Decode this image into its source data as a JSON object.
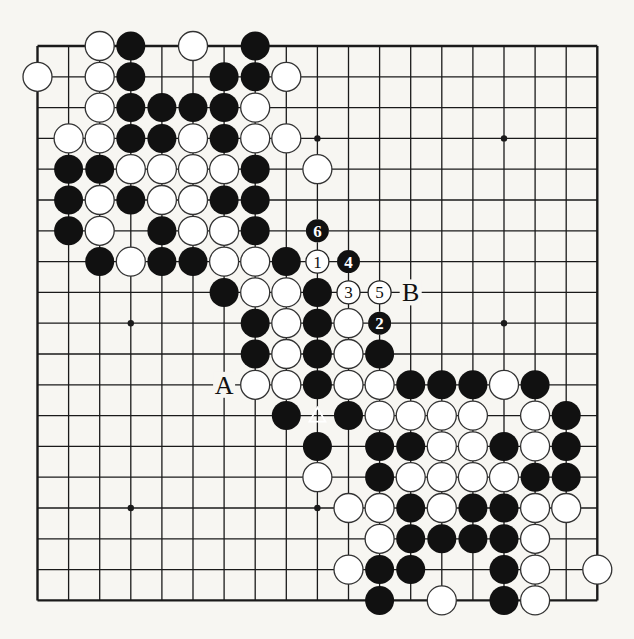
{
  "board": {
    "size": 19,
    "origin_x": 37.5,
    "origin_y": 46,
    "spacing_x": 31.1,
    "spacing_y": 30.8,
    "stone_radius": 14.5,
    "line_color": "#1a1a1a",
    "black_color": "#111111",
    "white_fill": "#ffffff",
    "star_points": [
      [
        3,
        3
      ],
      [
        9,
        3
      ],
      [
        15,
        3
      ],
      [
        3,
        9
      ],
      [
        9,
        9
      ],
      [
        15,
        9
      ],
      [
        3,
        15
      ],
      [
        9,
        15
      ],
      [
        15,
        15
      ]
    ],
    "stones": {
      "black": [
        [
          3,
          0
        ],
        [
          7,
          0
        ],
        [
          3,
          1
        ],
        [
          6,
          1
        ],
        [
          7,
          1
        ],
        [
          3,
          2
        ],
        [
          4,
          2
        ],
        [
          5,
          2
        ],
        [
          6,
          2
        ],
        [
          3,
          3
        ],
        [
          4,
          3
        ],
        [
          6,
          3
        ],
        [
          1,
          4
        ],
        [
          2,
          4
        ],
        [
          7,
          4
        ],
        [
          1,
          5
        ],
        [
          3,
          5
        ],
        [
          6,
          5
        ],
        [
          7,
          5
        ],
        [
          1,
          6
        ],
        [
          4,
          6
        ],
        [
          7,
          6
        ],
        [
          2,
          7
        ],
        [
          4,
          7
        ],
        [
          5,
          7
        ],
        [
          8,
          7
        ],
        [
          6,
          8
        ],
        [
          9,
          8
        ],
        [
          7,
          9
        ],
        [
          9,
          9
        ],
        [
          7,
          10
        ],
        [
          9,
          10
        ],
        [
          11,
          10
        ],
        [
          9,
          11
        ],
        [
          12,
          11
        ],
        [
          13,
          11
        ],
        [
          14,
          11
        ],
        [
          16,
          11
        ],
        [
          8,
          12
        ],
        [
          10,
          12
        ],
        [
          17,
          12
        ],
        [
          9,
          13
        ],
        [
          11,
          13
        ],
        [
          12,
          13
        ],
        [
          15,
          13
        ],
        [
          17,
          13
        ],
        [
          11,
          14
        ],
        [
          16,
          14
        ],
        [
          17,
          14
        ],
        [
          12,
          15
        ],
        [
          14,
          15
        ],
        [
          15,
          15
        ],
        [
          12,
          16
        ],
        [
          13,
          16
        ],
        [
          14,
          16
        ],
        [
          15,
          16
        ],
        [
          11,
          17
        ],
        [
          12,
          17
        ],
        [
          15,
          17
        ],
        [
          11,
          18
        ],
        [
          15,
          18
        ]
      ],
      "white": [
        [
          2,
          0
        ],
        [
          5,
          0
        ],
        [
          0,
          1
        ],
        [
          2,
          1
        ],
        [
          8,
          1
        ],
        [
          2,
          2
        ],
        [
          7,
          2
        ],
        [
          1,
          3
        ],
        [
          2,
          3
        ],
        [
          5,
          3
        ],
        [
          7,
          3
        ],
        [
          8,
          3
        ],
        [
          3,
          4
        ],
        [
          4,
          4
        ],
        [
          5,
          4
        ],
        [
          6,
          4
        ],
        [
          9,
          4
        ],
        [
          2,
          5
        ],
        [
          4,
          5
        ],
        [
          5,
          5
        ],
        [
          2,
          6
        ],
        [
          5,
          6
        ],
        [
          6,
          6
        ],
        [
          3,
          7
        ],
        [
          6,
          7
        ],
        [
          7,
          7
        ],
        [
          7,
          8
        ],
        [
          8,
          8
        ],
        [
          8,
          9
        ],
        [
          10,
          9
        ],
        [
          8,
          10
        ],
        [
          10,
          10
        ],
        [
          7,
          11
        ],
        [
          8,
          11
        ],
        [
          10,
          11
        ],
        [
          11,
          11
        ],
        [
          15,
          11
        ],
        [
          11,
          12
        ],
        [
          12,
          12
        ],
        [
          13,
          12
        ],
        [
          14,
          12
        ],
        [
          16,
          12
        ],
        [
          13,
          13
        ],
        [
          14,
          13
        ],
        [
          16,
          13
        ],
        [
          9,
          14
        ],
        [
          12,
          14
        ],
        [
          13,
          14
        ],
        [
          14,
          14
        ],
        [
          15,
          14
        ],
        [
          10,
          15
        ],
        [
          11,
          15
        ],
        [
          13,
          15
        ],
        [
          16,
          15
        ],
        [
          17,
          15
        ],
        [
          11,
          16
        ],
        [
          16,
          16
        ],
        [
          10,
          17
        ],
        [
          16,
          17
        ],
        [
          18,
          17
        ],
        [
          13,
          18
        ],
        [
          16,
          18
        ]
      ]
    },
    "marked_stone": {
      "x": 9,
      "y": 12,
      "color": "black",
      "mark": "triangle"
    },
    "numbered_moves": [
      {
        "label": "1",
        "x": 9,
        "y": 7,
        "color": "white"
      },
      {
        "label": "2",
        "x": 11,
        "y": 9,
        "color": "black"
      },
      {
        "label": "3",
        "x": 10,
        "y": 8,
        "color": "white"
      },
      {
        "label": "4",
        "x": 10,
        "y": 7,
        "color": "black"
      },
      {
        "label": "5",
        "x": 11,
        "y": 8,
        "color": "white"
      },
      {
        "label": "6",
        "x": 9,
        "y": 6,
        "color": "black"
      }
    ],
    "letter_labels": [
      {
        "label": "A",
        "x": 6,
        "y": 11
      },
      {
        "label": "B",
        "x": 12,
        "y": 8
      }
    ]
  }
}
